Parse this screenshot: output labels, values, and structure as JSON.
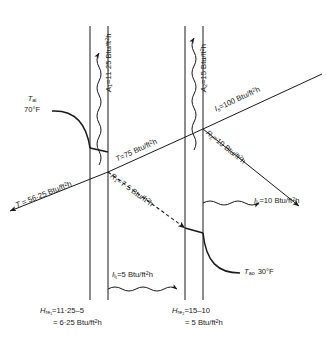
{
  "figure": {
    "units": "Btu/ft²h",
    "ink_color": "#1a1a1a"
  },
  "panes": [
    {
      "name": "inner-pane",
      "x_outer": 90,
      "x_inner": 108
    },
    {
      "name": "outer-pane",
      "x_outer": 185,
      "x_inner": 203
    }
  ],
  "labels": {
    "absorbed_pane1": {
      "sym": "A",
      "sub": "1",
      "eq": "=11·25 Btu/ft",
      "sup": "2",
      "tail": "h",
      "plain": "A1=11·25 Btu/ft2h"
    },
    "absorbed_pane2": {
      "sym": "A",
      "sub": "2",
      "eq": "=15 Btu/ft",
      "sup": "2",
      "tail": "h",
      "plain": "A2=15 Btu/ft2h"
    },
    "solar_incident": {
      "sym": "I",
      "sub": "s",
      "eq": "=100 Btu/ft",
      "sup": "2",
      "tail": "h",
      "plain": "Is=100 Btu/ft2h"
    },
    "reflected_outer": {
      "sym": "R",
      "sub": "2",
      "eq": "=10 Btu/ft",
      "sup": "2",
      "tail": "h",
      "plain": "R2=10 Btu/ft2h"
    },
    "transmitted_mid": {
      "sym": "T",
      "sub": "",
      "eq": "=75 Btu/ft",
      "sup": "2",
      "tail": "h",
      "plain": "T=75 Btu/ft2h"
    },
    "reflected_inner": {
      "sym": "R",
      "sub": "1",
      "eq": "=7·5 Btu/ft",
      "sup": "2",
      "tail": "h",
      "plain": "R1=7·5 Btu/ft2h"
    },
    "transmitted_final": {
      "sym": "T",
      "sub": "",
      "eq": " = 56·25 Btu/ft",
      "sup": "2",
      "tail": "h",
      "plain": "T = 56·25 Btu/ft2h"
    },
    "loss_inner": {
      "sym": "I",
      "sub": "l₁",
      "eq": "=5 Btu/ft",
      "sup": "2",
      "tail": "h",
      "plain": "Il1=5 Btu/ft2h"
    },
    "loss_outer": {
      "sym": "I",
      "sub": "l₂",
      "eq": "=10 Btu/ft",
      "sup": "2",
      "tail": "h",
      "plain": "Il2=10 Btu/ft2h"
    },
    "temp_inside": {
      "sym": "T",
      "sub": "ai",
      "value": "70°F"
    },
    "temp_outside": {
      "sym": "T",
      "sub": "ao",
      "value": "30°F"
    }
  },
  "equations": {
    "left": {
      "sym": "H",
      "sub": "re₁",
      "line1": "=11·25–5",
      "line2_pre": "= 6·25 Btu/ft",
      "line2_sup": "2",
      "line2_tail": "h",
      "plain": "Hre1=11·25-5 = 6·25 Btu/ft2h"
    },
    "right": {
      "sym": "H",
      "sub": "re₂",
      "line1": "=15–10",
      "line2_pre": "= 5 Btu/ft",
      "line2_sup": "2",
      "line2_tail": "h",
      "plain": "Hre2=15-10 = 5 Btu/ft2h"
    }
  }
}
